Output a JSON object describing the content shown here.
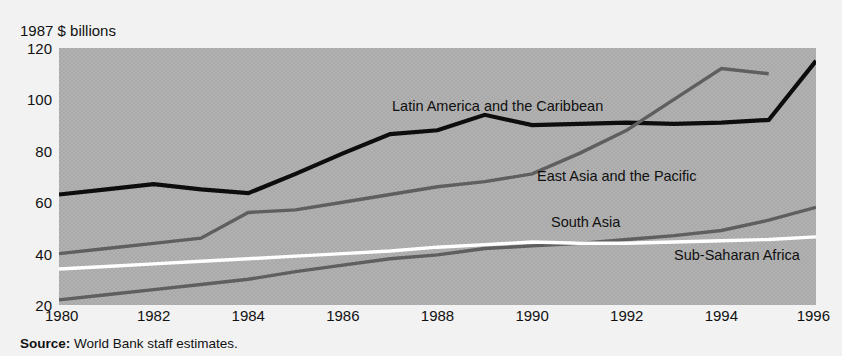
{
  "figure": {
    "unit_caption": "1987 $ billions",
    "source_label": "Source:",
    "source_text": " World Bank staff estimates."
  },
  "axes": {
    "y_ticks": [
      "120",
      "100",
      "80",
      "60",
      "40",
      "20"
    ],
    "x_ticks": [
      "1980",
      "1982",
      "1984",
      "1986",
      "1988",
      "1990",
      "1992",
      "1994",
      "1996"
    ]
  },
  "labels": {
    "latin_america": "Latin America and the Caribbean",
    "east_asia": "East Asia and the Pacific",
    "south_asia": "South Asia",
    "sub_saharan": "Sub-Saharan Africa"
  },
  "colors": {
    "plot_background": "#a9a9a9",
    "page_background": "#f2f2f2",
    "latin_america": "#0d0d0d",
    "east_asia": "#5f5f5f",
    "south_asia": "#5f5f5f",
    "sub_saharan": "#ffffff",
    "text": "#111111"
  },
  "chart_data": {
    "type": "line",
    "title": "",
    "subtitle": "",
    "xlabel": "",
    "ylabel": "1987 $ billions",
    "xlim": [
      1980,
      1996
    ],
    "ylim": [
      20,
      120
    ],
    "grid": false,
    "legend": "inline-annotations",
    "x": [
      1980,
      1981,
      1982,
      1983,
      1984,
      1985,
      1986,
      1987,
      1988,
      1989,
      1990,
      1991,
      1992,
      1993,
      1994,
      1995,
      1996
    ],
    "series": [
      {
        "name": "Latin America and the Caribbean",
        "color": "#0d0d0d",
        "values": [
          63,
          65,
          67,
          65,
          63.5,
          71,
          79,
          86.5,
          88,
          94,
          90,
          90.5,
          91,
          90.5,
          91,
          92,
          115
        ]
      },
      {
        "name": "East Asia and the Pacific",
        "color": "#5f5f5f",
        "values": [
          40,
          42,
          44,
          46,
          56,
          57,
          60,
          63,
          66,
          68,
          71,
          79,
          88,
          100,
          112,
          110,
          null
        ]
      },
      {
        "name": "South Asia",
        "color": "#5f5f5f",
        "values": [
          22,
          24,
          26,
          28,
          30,
          33,
          35.5,
          38,
          39.5,
          42,
          43,
          44,
          45.5,
          47,
          49,
          53,
          58
        ]
      },
      {
        "name": "Sub-Saharan Africa",
        "color": "#ffffff",
        "values": [
          34,
          35,
          36,
          37,
          38,
          39,
          40,
          41,
          42.5,
          43.5,
          44.5,
          44,
          44,
          44.5,
          45,
          45.5,
          46.5
        ]
      }
    ]
  }
}
